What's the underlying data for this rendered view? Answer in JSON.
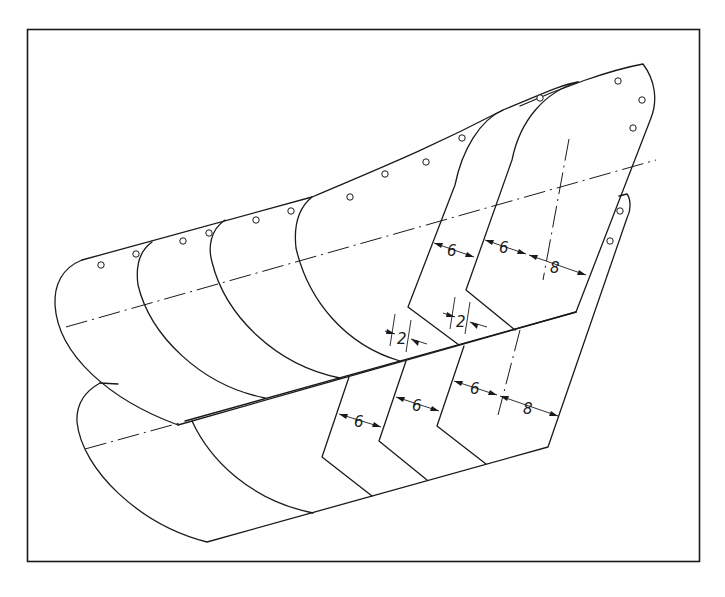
{
  "diagram": {
    "stroke_color": "#1a1a1a",
    "background": "#ffffff",
    "upper_part": {
      "segments": 6,
      "dimensions": {
        "overlap_left": "2",
        "overlap_right": "2",
        "width_a": "6",
        "width_b": "6",
        "width_end": "8"
      }
    },
    "lower_part": {
      "segments": 5,
      "dimensions": {
        "width_a": "6",
        "width_b": "6",
        "width_c": "6",
        "width_end": "8"
      }
    }
  }
}
